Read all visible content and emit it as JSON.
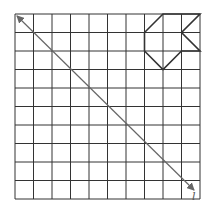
{
  "diagram": {
    "type": "grid-reflection",
    "grid": {
      "rows": 10,
      "cols": 10,
      "origin_px": [
        15,
        14
      ],
      "cell_px": 18.5,
      "line_color": "#333333"
    },
    "shape": {
      "name": "polygon",
      "vertices_grid": [
        [
          8,
          0
        ],
        [
          10,
          0
        ],
        [
          9,
          1
        ],
        [
          10,
          2
        ],
        [
          9,
          2
        ],
        [
          8,
          3
        ],
        [
          7,
          2
        ],
        [
          7,
          1
        ]
      ],
      "stroke": "#333333"
    },
    "line_of_reflection": {
      "label": "l",
      "from_grid": [
        0,
        0
      ],
      "to_grid": [
        10,
        10
      ],
      "arrows": "both",
      "color": "#666666"
    }
  }
}
